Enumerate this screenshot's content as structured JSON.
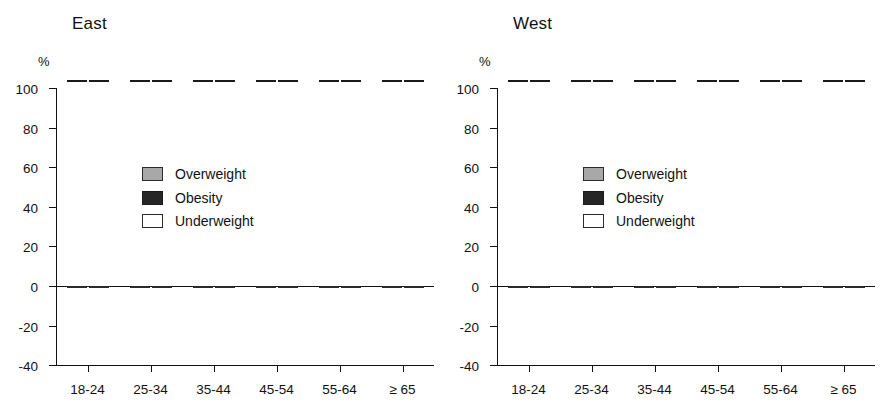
{
  "figure": {
    "panels": [
      "East",
      "West"
    ],
    "y_unit_label": "%"
  },
  "legend": {
    "items": [
      {
        "key": "overweight",
        "label": "Overweight",
        "color": "#a8a8a8"
      },
      {
        "key": "obesity",
        "label": "Obesity",
        "color": "#262626"
      },
      {
        "key": "underweight",
        "label": "Underweight",
        "color": "#ffffff"
      }
    ]
  },
  "axis": {
    "y_ticks": [
      "100",
      "80",
      "60",
      "40",
      "20",
      "0",
      "-20",
      "-40"
    ],
    "y_tick_values": [
      100,
      80,
      60,
      40,
      20,
      0,
      -20,
      -40
    ],
    "x_categories": [
      "18-24",
      "25-34",
      "35-44",
      "45-54",
      "55-64",
      "≥ 65"
    ]
  },
  "chart_data": [
    {
      "type": "bar",
      "title": "East",
      "xlabel": "",
      "ylabel": "%",
      "ylim": [
        -40,
        100
      ],
      "grid": false,
      "legend_position": "top-left inside",
      "stacked": true,
      "categories": [
        "18-24",
        "25-34",
        "35-44",
        "45-54",
        "55-64",
        "≥ 65"
      ],
      "bars_per_category": 2,
      "series": [
        {
          "name": "Overweight",
          "color": "#a8a8a8",
          "bar1": [
            26,
            31,
            38,
            38,
            48,
            44
          ],
          "bar2": [
            14,
            20,
            34,
            53,
            60,
            60
          ]
        },
        {
          "name": "Obesity",
          "color": "#262626",
          "bar1": [
            0.5,
            7,
            13,
            13,
            16,
            16
          ],
          "bar2": [
            3.5,
            5.5,
            6,
            12,
            21,
            10
          ]
        },
        {
          "name": "Underweight",
          "color": "#ffffff",
          "bar1": [
            -9,
            -2.5,
            -1.5,
            -1.5,
            -1.5,
            -1.5
          ],
          "bar2": [
            -22,
            -17,
            -3.5,
            -5,
            -2,
            -2.5
          ]
        }
      ],
      "totals_positive": {
        "bar1": [
          26.5,
          38,
          51,
          61,
          69,
          60
        ],
        "bar2": [
          17.5,
          25.5,
          40,
          65,
          81,
          70
        ]
      }
    },
    {
      "type": "bar",
      "title": "West",
      "xlabel": "",
      "ylabel": "%",
      "ylim": [
        -40,
        100
      ],
      "grid": false,
      "legend_position": "top-left inside",
      "stacked": true,
      "categories": [
        "18-24",
        "25-34",
        "35-44",
        "45-54",
        "55-64",
        "≥ 65"
      ],
      "bars_per_category": 2,
      "series": [
        {
          "name": "Overweight",
          "color": "#a8a8a8",
          "bar1": [
            15,
            29,
            48,
            53,
            54,
            57
          ],
          "bar2": [
            15.5,
            21,
            31.5,
            44,
            61,
            56.5
          ]
        },
        {
          "name": "Obesity",
          "color": "#262626",
          "bar1": [
            2,
            5,
            10,
            12,
            21,
            11
          ],
          "bar2": [
            4.5,
            7,
            10,
            16.5,
            15.5,
            18
          ]
        },
        {
          "name": "Underweight",
          "color": "#ffffff",
          "bar1": [
            -9,
            -9.5,
            -1.5,
            -1.5,
            -1.5,
            -1.5
          ],
          "bar2": [
            -11,
            -12,
            -4,
            -2.5,
            -1.5,
            -1.5
          ]
        }
      ],
      "totals_positive": {
        "bar1": [
          17,
          34,
          58,
          65,
          75,
          68
        ],
        "bar2": [
          20,
          28,
          41.5,
          60.5,
          76.5,
          74.5
        ]
      }
    }
  ]
}
